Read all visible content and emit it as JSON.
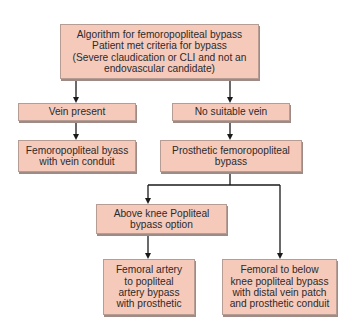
{
  "diagram": {
    "type": "flowchart",
    "colors": {
      "box_fill": "#f6cabb",
      "box_border": "#b79c94",
      "box_shadow": "#9f8b86",
      "line": "#1a1a1a",
      "text": "#2b2b2b",
      "background": "#ffffff"
    },
    "nodes": {
      "root": {
        "label": "Algorithm for femoropopliteal bypass\nPatient met criteria for bypass\n(Severe claudication or CLI and not an\nendovascular candidate)"
      },
      "vein_present": {
        "label": "Vein present"
      },
      "no_suitable_vein": {
        "label": "No suitable vein"
      },
      "fem_pop_vein": {
        "label": "Femoropopliteal byass\nwith vein conduit"
      },
      "prosthetic_fem_pop": {
        "label": "Prosthetic femoropopliteal\nbypass"
      },
      "above_knee": {
        "label": "Above knee Popliteal\nbypass option"
      },
      "fem_artery_prosthetic": {
        "label": "Femoral artery\nto popliteal\nartery bypass\nwith  prosthetic"
      },
      "fem_below_knee": {
        "label": "Femoral to below\nknee popliteal bypass\nwith distal vein patch\nand prosthetic conduit"
      }
    },
    "edges": [
      {
        "from": "root",
        "to": "vein_present"
      },
      {
        "from": "root",
        "to": "no_suitable_vein"
      },
      {
        "from": "vein_present",
        "to": "fem_pop_vein"
      },
      {
        "from": "no_suitable_vein",
        "to": "prosthetic_fem_pop"
      },
      {
        "from": "prosthetic_fem_pop",
        "to": "above_knee"
      },
      {
        "from": "prosthetic_fem_pop",
        "to": "fem_below_knee"
      },
      {
        "from": "above_knee",
        "to": "fem_artery_prosthetic"
      }
    ]
  }
}
